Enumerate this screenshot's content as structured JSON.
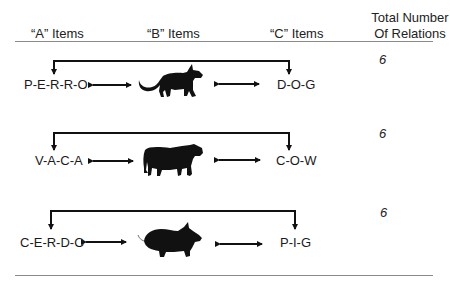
{
  "header": {
    "col_a": "“A” Items",
    "col_b": "“B” Items",
    "col_c": "“C” Items",
    "col_total_line1": "Total Number",
    "col_total_line2": "Of Relations"
  },
  "rows": [
    {
      "a_item": "P-E-R-R-O",
      "b_item": "dog-silhouette",
      "c_item": "D-O-G",
      "total": "6"
    },
    {
      "a_item": "V-A-C-A",
      "b_item": "cow-silhouette",
      "c_item": "C-O-W",
      "total": "6"
    },
    {
      "a_item": "C-E-R-D-O",
      "b_item": "pig-silhouette",
      "c_item": "P-I-G",
      "total": "6"
    }
  ]
}
